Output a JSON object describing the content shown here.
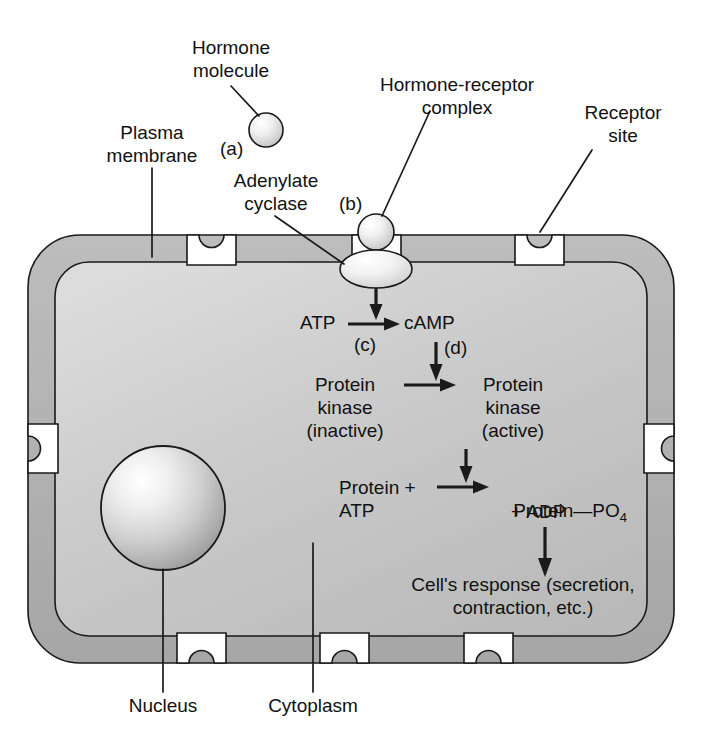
{
  "figure": {
    "colors": {
      "membrane_fill": "#b0b0b0",
      "cytoplasm_fill": "#c8c8c8",
      "outline": "#1a1a1a",
      "background": "#ffffff",
      "nucleus_light": "#ffffff",
      "nucleus_dark": "#9a9a9a",
      "molecule_light": "#ffffff",
      "molecule_dark": "#b5b5b5"
    }
  },
  "labels": {
    "hormone_molecule": "Hormone\nmolecule",
    "hormone_receptor_complex": "Hormone-receptor\ncomplex",
    "receptor_site": "Receptor\nsite",
    "plasma_membrane": "Plasma\nmembrane",
    "adenylate_cyclase": "Adenylate\ncyclase",
    "nucleus": "Nucleus",
    "cytoplasm": "Cytoplasm"
  },
  "steps": {
    "a": "(a)",
    "b": "(b)",
    "c": "(c)",
    "d": "(d)"
  },
  "cascade": {
    "atp": "ATP",
    "camp": "cAMP",
    "protein_kinase_inactive": "Protein\nkinase\n(inactive)",
    "protein_kinase_active": "Protein\nkinase\n(active)",
    "protein_plus_atp": "Protein +\nATP",
    "protein_po4_main": "Protein—PO",
    "protein_po4_sub": "4",
    "plus_adp": "+ ADP",
    "cell_response": "Cell's response (secretion,\ncontraction, etc.)"
  },
  "icons": {
    "hormone_free": "hormone-sphere-icon",
    "hormone_bound": "hormone-sphere-icon",
    "adenylate_cyclase": "enzyme-ellipse-icon",
    "nucleus": "nucleus-sphere-icon",
    "receptor_notch": "receptor-notch-icon",
    "arrow": "arrow-icon"
  },
  "receptor_sites": {
    "count": 8,
    "positions": [
      "top-left",
      "top-center",
      "top-right",
      "left-mid",
      "right-mid",
      "bottom-left",
      "bottom-center",
      "bottom-right"
    ]
  }
}
